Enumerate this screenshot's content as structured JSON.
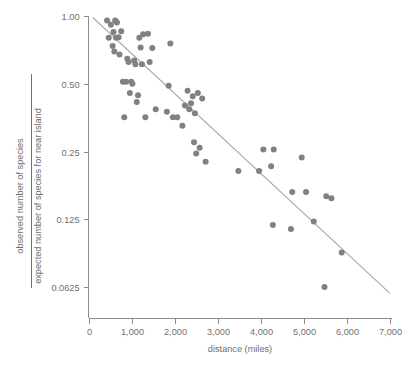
{
  "chart_data": {
    "type": "scatter",
    "title": "",
    "xlabel": "distance (miles)",
    "ylabel_numerator": "observed number of species",
    "ylabel_denominator": "expected number of species for near island",
    "xlim": [
      0,
      7000
    ],
    "ylim": [
      0.0625,
      1.0
    ],
    "yscale": "log2",
    "grid": false,
    "legend": null,
    "xticks": [
      0,
      1000,
      2000,
      3000,
      4000,
      5000,
      6000,
      7000
    ],
    "xticklabels": [
      "0",
      "1,000",
      "2,000",
      "3,000",
      "4,000",
      "5,000",
      "6,000",
      "7,000"
    ],
    "yticks": [
      1.0,
      0.5,
      0.25,
      0.125,
      0.0625
    ],
    "yticklabels": [
      "1.00",
      "0.50",
      "0.25",
      "0.125",
      "0.0625"
    ],
    "point_color": "#818181",
    "line_color": "#a9a9a9",
    "axis_color": "#8d8d8d",
    "marker_size": 6,
    "trend_line": {
      "x": [
        100,
        7000
      ],
      "y": [
        0.985,
        0.0585
      ]
    },
    "x": [
      430,
      470,
      520,
      560,
      580,
      600,
      620,
      640,
      660,
      700,
      720,
      760,
      800,
      830,
      870,
      900,
      930,
      960,
      990,
      1020,
      1060,
      1090,
      1120,
      1150,
      1180,
      1210,
      1240,
      1270,
      1320,
      1380,
      1420,
      1480,
      1560,
      1820,
      1860,
      1900,
      1960,
      2060,
      2180,
      2240,
      2300,
      2340,
      2380,
      2420,
      2450,
      2470,
      2500,
      2540,
      2580,
      2640,
      2720,
      3480,
      3960,
      4060,
      4240,
      4280,
      4300,
      4700,
      4730,
      4950,
      5050,
      5230,
      5480,
      5520,
      5640,
      5880
    ],
    "y": [
      0.955,
      0.8,
      0.915,
      0.735,
      0.85,
      0.695,
      0.955,
      0.8,
      0.935,
      0.805,
      0.675,
      0.855,
      0.51,
      0.355,
      0.51,
      0.645,
      0.625,
      0.455,
      0.51,
      0.5,
      0.635,
      0.61,
      0.415,
      0.445,
      0.8,
      0.725,
      0.61,
      0.83,
      0.355,
      0.835,
      0.625,
      0.72,
      0.385,
      0.375,
      0.49,
      0.755,
      0.355,
      0.355,
      0.325,
      0.4,
      0.465,
      0.385,
      0.41,
      0.44,
      0.275,
      0.37,
      0.245,
      0.455,
      0.26,
      0.43,
      0.225,
      0.205,
      0.205,
      0.255,
      0.215,
      0.118,
      0.255,
      0.113,
      0.165,
      0.235,
      0.165,
      0.122,
      0.0625,
      0.158,
      0.155,
      0.089
    ]
  },
  "figure": {
    "background": "#ffffff"
  }
}
